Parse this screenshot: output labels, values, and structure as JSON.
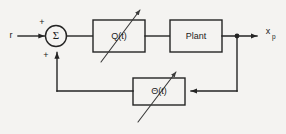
{
  "diagram": {
    "background_color": "#f4f3f1",
    "line_color": "#242424",
    "signals": {
      "reference_input": "r",
      "output_symbol": "x",
      "output_subscript": "p"
    },
    "summing_junction": {
      "symbol": "Σ",
      "sign_reference": "+",
      "sign_feedback": "+"
    },
    "blocks": [
      {
        "id": "controller",
        "label": "Q(t)",
        "variable": true
      },
      {
        "id": "plant",
        "label": "Plant",
        "variable": false
      },
      {
        "id": "feedback",
        "label": "Θ(t)",
        "variable": true
      }
    ]
  }
}
